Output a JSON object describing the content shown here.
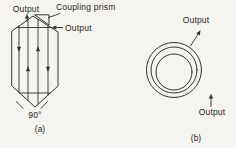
{
  "figure": {
    "panel_a": {
      "caption": "(a)",
      "labels": {
        "output_top": "Output",
        "coupling_prism": "Coupling prism",
        "output_side": "Output",
        "angle": "90°"
      }
    },
    "panel_b": {
      "caption": "(b)",
      "labels": {
        "output_upper": "Output",
        "output_lower": "Output"
      }
    },
    "colors": {
      "ink": "#32322e",
      "background": "#f5f4f0"
    }
  }
}
